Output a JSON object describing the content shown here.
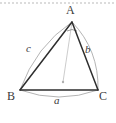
{
  "figure": {
    "background_color": "#ffffff",
    "top_rule": {
      "name": "dashed-top-rule",
      "color": "#b9b9b9",
      "dash": "2 2",
      "y": 3
    },
    "vertices": [
      {
        "id": "A",
        "label": "A",
        "x": 72,
        "y": 22,
        "role": "apex"
      },
      {
        "id": "B",
        "label": "B",
        "x": 20,
        "y": 90,
        "role": "bottom-left"
      },
      {
        "id": "C",
        "label": "C",
        "x": 98,
        "y": 90,
        "role": "bottom-right"
      }
    ],
    "sides": [
      {
        "id": "a",
        "label": "a",
        "from": "B",
        "to": "C",
        "opposite_vertex": "A",
        "style": "italic"
      },
      {
        "id": "b",
        "label": "b",
        "from": "A",
        "to": "C",
        "opposite_vertex": "B",
        "style": "italic"
      },
      {
        "id": "c",
        "label": "c",
        "from": "A",
        "to": "B",
        "opposite_vertex": "C",
        "style": "italic"
      }
    ],
    "edge_color": "#2e2e2e",
    "arc_color": "#a8a8a8",
    "arcs": [
      {
        "id": "arc-a",
        "along_side": "a",
        "bulge": "outward-down"
      },
      {
        "id": "arc-b",
        "along_side": "b",
        "bulge": "outward-right"
      },
      {
        "id": "arc-c",
        "along_side": "c",
        "bulge": "outward-left"
      }
    ],
    "angle_marker": {
      "id": "angle-at-A",
      "at_vertex": "A",
      "color": "#8f8f8f"
    },
    "cevian": {
      "id": "cevian-from-A",
      "from": "A",
      "to_x": 63,
      "to_y": 82,
      "color": "#c4c4c4",
      "endpoint_marker": true
    }
  }
}
